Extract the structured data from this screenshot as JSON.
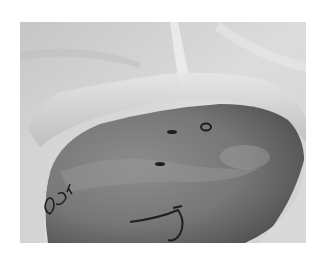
{
  "image": {
    "description": "Grayscale photograph of a draped surgical field showing an exposed skin area with marker annotations",
    "colors": {
      "background": "#ffffff",
      "drape_light": "#e2e2e2",
      "drape_mid": "#c9c9c9",
      "skin_dark": "#5e5e5e",
      "skin_mid": "#858585",
      "marker_ink": "#1e1e1e"
    },
    "markings": [
      {
        "type": "dash",
        "label": "incision-mark-top"
      },
      {
        "type": "circle",
        "label": "circled-point"
      },
      {
        "type": "dash",
        "label": "incision-mark-middle"
      },
      {
        "type": "handwriting",
        "label": "handwritten-letters"
      },
      {
        "type": "curve",
        "label": "hook-shaped-line"
      }
    ]
  }
}
